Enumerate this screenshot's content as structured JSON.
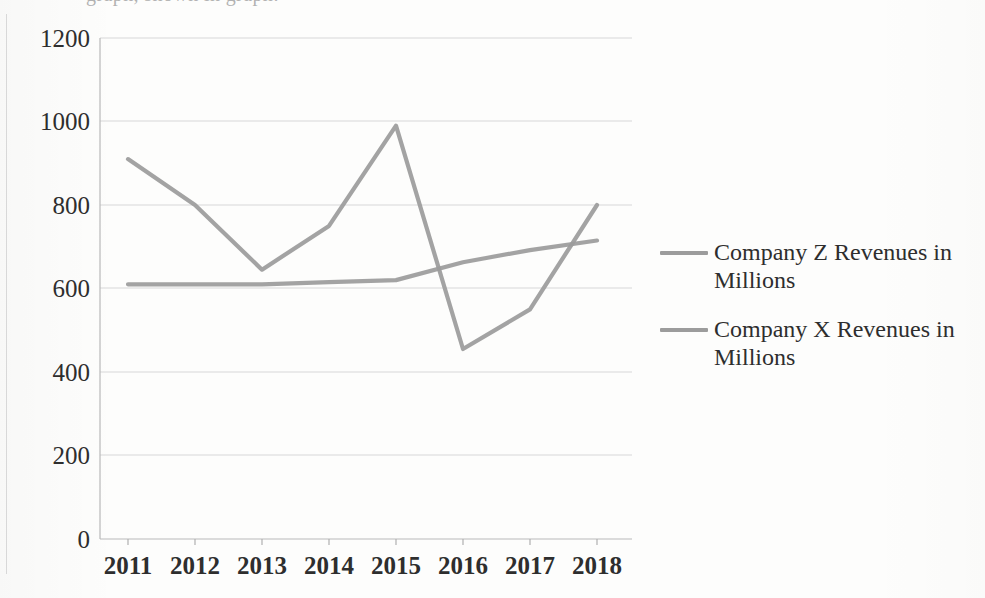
{
  "page": {
    "clipped_caption_above": "graph, shown in graph:"
  },
  "chart_data": {
    "type": "line",
    "title": "",
    "subtitle": "",
    "xlabel": "",
    "ylabel": "",
    "categories": [
      "2011",
      "2012",
      "2013",
      "2014",
      "2015",
      "2016",
      "2017",
      "2018"
    ],
    "series": [
      {
        "name": "Company Z Revenues in Millions",
        "color": "#9b9b9b",
        "values": [
          910,
          800,
          645,
          750,
          990,
          455,
          550,
          800
        ]
      },
      {
        "name": "Company X Revenues in Millions",
        "color": "#9b9b9b",
        "values": [
          610,
          610,
          610,
          615,
          620,
          663,
          692,
          715
        ]
      }
    ],
    "ylim": [
      0,
      1200
    ],
    "ytick_labels": [
      "0",
      "200",
      "400",
      "600",
      "800",
      "1000",
      "1200"
    ],
    "ytick_values": [
      0,
      200,
      400,
      600,
      800,
      1000,
      1200
    ],
    "grid": true,
    "grid_axis": "y",
    "legend_position": "right",
    "legend_entries": [
      "Company Z Revenues in Millions",
      "Company X Revenues in Millions"
    ]
  },
  "axis": {
    "y_labels": [
      "1200",
      "1000",
      "800",
      "600",
      "400",
      "200",
      "0"
    ],
    "x_labels": [
      "2011",
      "2012",
      "2013",
      "2014",
      "2015",
      "2016",
      "2017",
      "2018"
    ]
  },
  "legend": {
    "items": [
      {
        "label": "Company Z Revenues in Millions"
      },
      {
        "label": "Company X Revenues in Millions"
      }
    ]
  }
}
